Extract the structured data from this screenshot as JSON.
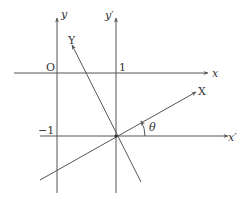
{
  "diagram": {
    "type": "coordinate-rotation",
    "labels": {
      "y_axis": "y",
      "y_prime_axis": "y′",
      "x_axis": "x",
      "x_prime_axis": "x′",
      "X_axis": "X",
      "Y_axis": "Y",
      "origin": "O",
      "tick_one": "1",
      "tick_minus_one": "−1",
      "angle": "θ"
    },
    "colors": {
      "line": "#555555",
      "text": "#333333",
      "background": "#ffffff"
    }
  }
}
